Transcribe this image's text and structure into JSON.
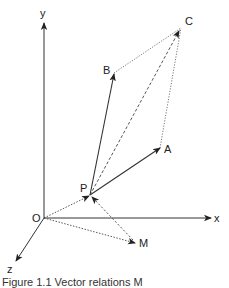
{
  "diagram": {
    "axes": {
      "x_label": "x",
      "y_label": "y",
      "z_label": "z",
      "origin_label": "O"
    },
    "points": {
      "P": "P",
      "A": "A",
      "B": "B",
      "C": "C",
      "M": "M"
    },
    "edges": [
      {
        "from": "O",
        "to": "x",
        "style": "solid-arrow"
      },
      {
        "from": "O",
        "to": "y",
        "style": "solid-arrow"
      },
      {
        "from": "O",
        "to": "z",
        "style": "solid-arrow"
      },
      {
        "from": "P",
        "to": "A",
        "style": "solid-arrow"
      },
      {
        "from": "P",
        "to": "B",
        "style": "solid-arrow"
      },
      {
        "from": "P",
        "to": "C",
        "style": "dashed-arrow"
      },
      {
        "from": "B",
        "to": "C",
        "style": "dotted"
      },
      {
        "from": "A",
        "to": "C",
        "style": "dotted"
      },
      {
        "from": "O",
        "to": "P",
        "style": "dotted-arrow"
      },
      {
        "from": "O",
        "to": "M",
        "style": "dotted-arrow"
      },
      {
        "from": "M",
        "to": "P",
        "style": "dotted-arrow"
      }
    ],
    "colors": {
      "line": "#333333",
      "background": "#ffffff"
    }
  },
  "caption": "Figure 1.1 Vector relations M"
}
